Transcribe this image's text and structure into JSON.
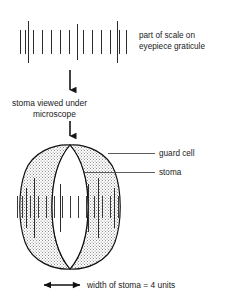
{
  "figure": {
    "background_color": "#ffffff",
    "ink_color": "#1a1a1a"
  },
  "graticule": {
    "caption_line1": "part of scale on",
    "caption_line2": "eyepiece graticule",
    "short_tick_count": 14,
    "major_tick_count": 3,
    "unit_label": "units",
    "tick_color": "#2b2b2b",
    "short_ticks_x": [
      20,
      25,
      33,
      42,
      51,
      60,
      69,
      83,
      92,
      101,
      110,
      119,
      126
    ],
    "major_ticks_x": [
      28,
      77,
      117
    ],
    "short_tick_top": 30,
    "short_tick_bottom": 54,
    "major_tick_top": 22,
    "major_tick_bottom": 62
  },
  "arrow": {
    "label_line1": "stoma viewed under",
    "label_line2": "microscope",
    "direction": "down",
    "color": "#151515"
  },
  "stoma": {
    "labels": [
      {
        "id": "guard-cell",
        "text": "guard cell"
      },
      {
        "id": "stoma",
        "text": "stoma"
      }
    ],
    "guard_cell_fill": "stipple",
    "pore_fill": "#ffffff",
    "outline_color": "#111111",
    "overlay_short_ticks_x": [
      17,
      22,
      30,
      38,
      46,
      54,
      62,
      70,
      78,
      86,
      94,
      102,
      110,
      118
    ],
    "overlay_major_ticks_x": [
      26,
      34,
      60,
      88,
      98,
      114
    ],
    "overlay_short_top": 196,
    "overlay_short_bottom": 218,
    "overlay_major_top": 178,
    "overlay_major_bottom": 238
  },
  "measurement": {
    "text": "width of stoma = 4 units",
    "value": 4,
    "unit": "units",
    "arrow_style": "double-headed",
    "arrow_left_x": 42,
    "arrow_right_x": 82,
    "arrow_y": 285
  }
}
